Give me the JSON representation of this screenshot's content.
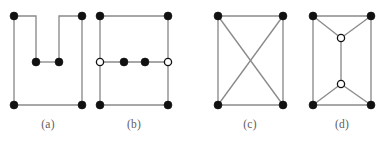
{
  "figure": {
    "width": 387,
    "height": 141,
    "background_color": "#ffffff",
    "edge_color": "#8a8a8a",
    "filled_node_color": "#111111",
    "open_node_color": "#ffffff",
    "node_outline_color": "#111111",
    "caption_color": "#5d5d5d"
  },
  "panels": [
    {
      "id": "graph-a",
      "caption": "(a)",
      "caption_x": 48,
      "caption_y": 126,
      "nodes": [
        {
          "id": "a-top-left",
          "x": 14,
          "y": 16,
          "type": "filled"
        },
        {
          "id": "a-top-right",
          "x": 82,
          "y": 16,
          "type": "filled"
        },
        {
          "id": "a-mid-left",
          "x": 36,
          "y": 62,
          "type": "filled"
        },
        {
          "id": "a-mid-right",
          "x": 59,
          "y": 62,
          "type": "filled"
        },
        {
          "id": "a-bottom-left",
          "x": 14,
          "y": 105,
          "type": "filled"
        },
        {
          "id": "a-bottom-right",
          "x": 82,
          "y": 105,
          "type": "filled"
        }
      ],
      "edges": [
        {
          "from": "a-top-left",
          "to": "a-bottom-left"
        },
        {
          "from": "a-top-left",
          "to": "a-mid-left"
        },
        {
          "from": "a-mid-left",
          "to": "a-mid-right"
        },
        {
          "from": "a-mid-right",
          "to": "a-top-right"
        },
        {
          "from": "a-top-right",
          "to": "a-bottom-right"
        },
        {
          "from": "a-bottom-left",
          "to": "a-bottom-right"
        }
      ],
      "edge_paths": [
        "M 14 16 L 14 105",
        "M 14 16 L 36 16 L 36 62",
        "M 36 62 L 59 62",
        "M 59 62 L 59 16 L 82 16",
        "M 82 16 L 82 105",
        "M 14 105 L 82 105"
      ]
    },
    {
      "id": "graph-b",
      "caption": "(b)",
      "caption_x": 134,
      "caption_y": 126,
      "nodes": [
        {
          "id": "b-top-left",
          "x": 100,
          "y": 16,
          "type": "filled"
        },
        {
          "id": "b-top-right",
          "x": 168,
          "y": 16,
          "type": "filled"
        },
        {
          "id": "b-mid-left",
          "x": 100,
          "y": 62,
          "type": "open"
        },
        {
          "id": "b-mid-inner-1",
          "x": 124,
          "y": 62,
          "type": "filled"
        },
        {
          "id": "b-mid-inner-2",
          "x": 145,
          "y": 62,
          "type": "filled"
        },
        {
          "id": "b-mid-right",
          "x": 168,
          "y": 62,
          "type": "open"
        },
        {
          "id": "b-bottom-left",
          "x": 100,
          "y": 105,
          "type": "filled"
        },
        {
          "id": "b-bottom-right",
          "x": 168,
          "y": 105,
          "type": "filled"
        }
      ],
      "edges": [
        {
          "from": "b-top-left",
          "to": "b-top-right"
        },
        {
          "from": "b-top-left",
          "to": "b-mid-left"
        },
        {
          "from": "b-top-right",
          "to": "b-mid-right"
        },
        {
          "from": "b-mid-left",
          "to": "b-mid-inner-1"
        },
        {
          "from": "b-mid-inner-1",
          "to": "b-mid-inner-2"
        },
        {
          "from": "b-mid-inner-2",
          "to": "b-mid-right"
        },
        {
          "from": "b-mid-left",
          "to": "b-bottom-left"
        },
        {
          "from": "b-mid-right",
          "to": "b-bottom-right"
        },
        {
          "from": "b-bottom-left",
          "to": "b-bottom-right"
        }
      ],
      "edge_paths": [
        "M 100 16 L 168 16",
        "M 100 16 L 100 105",
        "M 168 16 L 168 105",
        "M 100 62 L 168 62",
        "M 100 105 L 168 105"
      ]
    },
    {
      "id": "graph-c",
      "caption": "(c)",
      "caption_x": 250,
      "caption_y": 126,
      "nodes": [
        {
          "id": "c-top-left",
          "x": 218,
          "y": 16,
          "type": "filled"
        },
        {
          "id": "c-top-right",
          "x": 283,
          "y": 16,
          "type": "filled"
        },
        {
          "id": "c-bottom-left",
          "x": 218,
          "y": 105,
          "type": "filled"
        },
        {
          "id": "c-bottom-right",
          "x": 283,
          "y": 105,
          "type": "filled"
        }
      ],
      "edges": [
        {
          "from": "c-top-left",
          "to": "c-top-right"
        },
        {
          "from": "c-top-left",
          "to": "c-bottom-left"
        },
        {
          "from": "c-top-right",
          "to": "c-bottom-right"
        },
        {
          "from": "c-bottom-left",
          "to": "c-bottom-right"
        },
        {
          "from": "c-top-left",
          "to": "c-bottom-right"
        },
        {
          "from": "c-top-right",
          "to": "c-bottom-left"
        }
      ],
      "edge_paths": [
        "M 218 16 L 283 16",
        "M 218 16 L 218 105",
        "M 283 16 L 283 105",
        "M 218 105 L 283 105",
        "M 218 16 L 283 105",
        "M 283 16 L 218 105"
      ]
    },
    {
      "id": "graph-d",
      "caption": "(d)",
      "caption_x": 342,
      "caption_y": 126,
      "nodes": [
        {
          "id": "d-top-left",
          "x": 313,
          "y": 16,
          "type": "filled"
        },
        {
          "id": "d-top-right",
          "x": 371,
          "y": 16,
          "type": "filled"
        },
        {
          "id": "d-center-upper",
          "x": 341,
          "y": 38,
          "type": "open"
        },
        {
          "id": "d-center-lower",
          "x": 341,
          "y": 84,
          "type": "open"
        },
        {
          "id": "d-bottom-left",
          "x": 313,
          "y": 105,
          "type": "filled"
        },
        {
          "id": "d-bottom-right",
          "x": 371,
          "y": 105,
          "type": "filled"
        }
      ],
      "edges": [
        {
          "from": "d-top-left",
          "to": "d-top-right"
        },
        {
          "from": "d-top-left",
          "to": "d-bottom-left"
        },
        {
          "from": "d-top-right",
          "to": "d-bottom-right"
        },
        {
          "from": "d-bottom-left",
          "to": "d-bottom-right"
        },
        {
          "from": "d-top-left",
          "to": "d-center-upper"
        },
        {
          "from": "d-top-right",
          "to": "d-center-upper"
        },
        {
          "from": "d-center-upper",
          "to": "d-center-lower"
        },
        {
          "from": "d-bottom-left",
          "to": "d-center-lower"
        },
        {
          "from": "d-bottom-right",
          "to": "d-center-lower"
        }
      ],
      "edge_paths": [
        "M 313 16 L 371 16",
        "M 313 16 L 313 105",
        "M 371 16 L 371 105",
        "M 313 105 L 371 105",
        "M 313 16 L 341 38",
        "M 371 16 L 341 38",
        "M 341 38 L 341 84",
        "M 313 105 L 341 84",
        "M 371 105 L 341 84"
      ]
    }
  ]
}
